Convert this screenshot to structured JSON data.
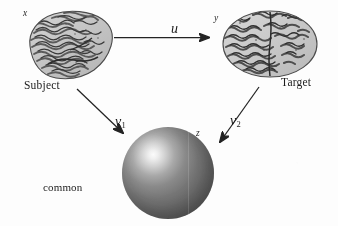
{
  "figure": {
    "type": "diagram",
    "background_color": "#fdfdfd",
    "ink_color": "#1c1c1c"
  },
  "nodes": {
    "subject_brain": {
      "variable_label": "x",
      "caption": "Subject"
    },
    "target_brain": {
      "variable_label": "y",
      "caption": "Target"
    },
    "sphere": {
      "variable_label": "z",
      "caption_lines": [
        "common",
        "parametric",
        "space"
      ],
      "surface_color": "#767676",
      "highlight_color": "#fbfbfb"
    }
  },
  "arrows": {
    "u": {
      "label": "u",
      "subscript": "",
      "from": "subject_brain",
      "to": "target_brain",
      "direction": "right"
    },
    "v1": {
      "label": "v",
      "subscript": "1",
      "from": "subject_brain",
      "to": "sphere",
      "direction": "down-right"
    },
    "v2": {
      "label": "v",
      "subscript": "2",
      "from": "target_brain",
      "to": "sphere",
      "direction": "down-left"
    }
  }
}
